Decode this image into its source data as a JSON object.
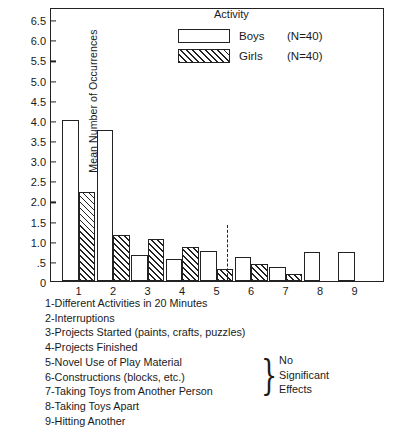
{
  "chart_data": {
    "type": "bar",
    "title": "",
    "xlabel": "",
    "ylabel": "Mean Number of Occurrences",
    "ylim": [
      0,
      6.8
    ],
    "grid": false,
    "legend_position": "top-center",
    "legend_title": "Activity",
    "categories": [
      "1",
      "2",
      "3",
      "4",
      "5",
      "6",
      "7",
      "8",
      "9"
    ],
    "ytick_labels": [
      "0",
      ".5",
      "1.0",
      "1.5",
      "2.0",
      "2.5",
      "3.0",
      "3.5",
      "4.0",
      "4.5",
      "5.0",
      "5.5",
      "6.0",
      "6.5"
    ],
    "ytick_values": [
      0,
      0.5,
      1.0,
      1.5,
      2.0,
      2.5,
      3.0,
      3.5,
      4.0,
      4.5,
      5.0,
      5.5,
      6.0,
      6.5
    ],
    "series": [
      {
        "name": "Boys",
        "n_label": "(N=40)",
        "fill": "open",
        "values": [
          4.0,
          3.75,
          0.65,
          0.55,
          0.75,
          0.6,
          0.35,
          0.72,
          0.72
        ]
      },
      {
        "name": "Girls",
        "n_label": "(N=40)",
        "fill": "hatched",
        "values": [
          2.2,
          1.15,
          1.05,
          0.85,
          0.3,
          0.42,
          0.18,
          0,
          0
        ]
      }
    ],
    "annotations": [
      {
        "name": "significance-divider",
        "type": "dashed-vline",
        "between": [
          "5",
          "6"
        ],
        "top_value": 1.4
      }
    ]
  },
  "caption": {
    "items": [
      "1-Different Activities in 20 Minutes",
      "2-Interruptions",
      "3-Projects Started (paints, crafts, puzzles)",
      "4-Projects Finished",
      "5-Novel Use of Play Material",
      "6-Constructions (blocks, etc.)",
      "7-Taking Toys from Another Person",
      "8-Taking Toys Apart",
      "9-Hitting Another"
    ],
    "brace_glyph": "}",
    "brace_text_lines": [
      "No",
      "Significant",
      "Effects"
    ]
  }
}
